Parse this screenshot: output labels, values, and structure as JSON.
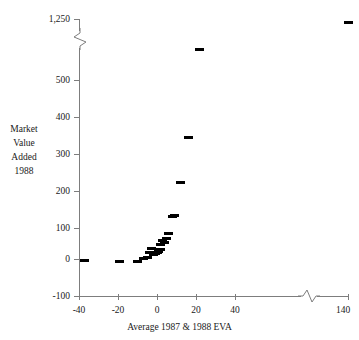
{
  "chart_data": {
    "type": "scatter",
    "title": "",
    "xlabel": "Average 1987 & 1988 EVA",
    "ylabel": "Market Value Added 1988",
    "ylabel_lines": [
      "Market",
      "Value",
      "Added",
      "1988"
    ],
    "xlim": [
      -45,
      145
    ],
    "ylim": [
      -100,
      1250
    ],
    "x_ticks": [
      -40,
      -20,
      0,
      20,
      40,
      140
    ],
    "x_tick_labels": [
      "-40",
      "-20",
      "0",
      "20",
      "40",
      "140"
    ],
    "y_ticks": [
      -100,
      0,
      100,
      200,
      300,
      400,
      500,
      1250
    ],
    "y_tick_labels": [
      "-100",
      "0",
      "100",
      "200",
      "300",
      "400",
      "500",
      "1,250"
    ],
    "grid": false,
    "legend": null,
    "axis_breaks": {
      "y_break_between": [
        500,
        1250
      ],
      "x_break_between": [
        50,
        130
      ]
    },
    "marker": "horizontal-dash",
    "marker_color": "#000000",
    "points": [
      {
        "x": -37,
        "y": 0
      },
      {
        "x": -19,
        "y": -3
      },
      {
        "x": -10,
        "y": -4
      },
      {
        "x": -7,
        "y": 5
      },
      {
        "x": -5,
        "y": 8
      },
      {
        "x": -4,
        "y": 20
      },
      {
        "x": -3,
        "y": 33
      },
      {
        "x": -2,
        "y": 14
      },
      {
        "x": -1,
        "y": 18
      },
      {
        "x": 0,
        "y": 22
      },
      {
        "x": 1,
        "y": 25
      },
      {
        "x": 1,
        "y": 30
      },
      {
        "x": 2,
        "y": 28
      },
      {
        "x": 2,
        "y": 44
      },
      {
        "x": 3,
        "y": 55
      },
      {
        "x": 4,
        "y": 48
      },
      {
        "x": 5,
        "y": 60
      },
      {
        "x": 6,
        "y": 75
      },
      {
        "x": 8,
        "y": 120
      },
      {
        "x": 9,
        "y": 125
      },
      {
        "x": 12,
        "y": 215
      },
      {
        "x": 16,
        "y": 340
      },
      {
        "x": 22,
        "y": 640
      },
      {
        "x": 140,
        "y": 1235
      }
    ]
  },
  "axes": {
    "y_axis_name": "market-value-added-axis",
    "x_axis_name": "average-eva-axis"
  }
}
